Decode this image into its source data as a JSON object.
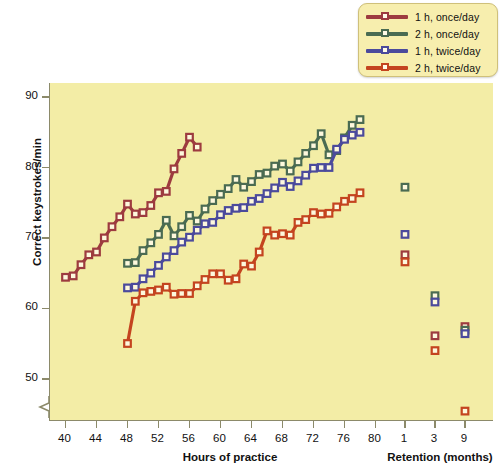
{
  "legend": {
    "items": [
      {
        "label": "1 h, once/day",
        "color": "#9d3b3f"
      },
      {
        "label": "2 h, once/day",
        "color": "#4a6b52"
      },
      {
        "label": "1 h, twice/day",
        "color": "#4b4a9c"
      },
      {
        "label": "2 h, twice/day",
        "color": "#c4441f"
      }
    ]
  },
  "chart_data": {
    "type": "line",
    "title": "",
    "xlabel": "Hours of practice",
    "ylabel": "Correct keystrokes/min",
    "secondary_xlabel": "Retention (months)",
    "xlim": [
      38,
      82
    ],
    "ylim": [
      44,
      92
    ],
    "yticks": [
      50,
      60,
      70,
      80,
      90
    ],
    "xticks": [
      40,
      44,
      48,
      52,
      56,
      60,
      64,
      68,
      72,
      76,
      80
    ],
    "retention_ticks": [
      1,
      3,
      9
    ],
    "grid": false,
    "legend_position": "top-right",
    "axis_break": true,
    "series": [
      {
        "name": "1 h, once/day",
        "color": "#9d3b3f",
        "x": [
          40,
          41,
          42,
          43,
          44,
          45,
          46,
          47,
          48,
          49,
          50,
          51,
          52,
          53,
          54,
          55,
          56,
          57
        ],
        "y": [
          64.4,
          64.6,
          66.2,
          67.6,
          68.0,
          70.0,
          71.6,
          73.0,
          74.8,
          73.4,
          73.6,
          74.6,
          76.4,
          76.6,
          79.8,
          82.0,
          84.3,
          82.9
        ],
        "retention": [
          {
            "months": 1,
            "value": 67.6
          },
          {
            "months": 3,
            "value": 56.1
          },
          {
            "months": 9,
            "value": 57.4
          }
        ]
      },
      {
        "name": "2 h, once/day",
        "color": "#4a6b52",
        "x": [
          48,
          49,
          50,
          51,
          52,
          53,
          54,
          55,
          56,
          57,
          58,
          59,
          60,
          61,
          62,
          63,
          64,
          65,
          66,
          67,
          68,
          69,
          70,
          71,
          72,
          73,
          74,
          75,
          76,
          77,
          78
        ],
        "y": [
          66.4,
          66.5,
          68.2,
          69.3,
          70.5,
          72.5,
          70.3,
          71.6,
          73.2,
          72.4,
          74.1,
          75.3,
          76.2,
          77.0,
          78.3,
          77.2,
          78.0,
          79.0,
          79.2,
          80.2,
          80.5,
          79.5,
          80.8,
          82.0,
          83.1,
          84.8,
          81.8,
          82.4,
          84.2,
          86.0,
          86.8
        ],
        "retention": [
          {
            "months": 1,
            "value": 77.2
          },
          {
            "months": 3,
            "value": 61.8
          },
          {
            "months": 9,
            "value": 56.9
          }
        ]
      },
      {
        "name": "1 h, twice/day",
        "color": "#4b4a9c",
        "x": [
          48,
          49,
          50,
          51,
          52,
          53,
          54,
          55,
          56,
          57,
          58,
          59,
          60,
          61,
          62,
          63,
          64,
          65,
          66,
          67,
          68,
          69,
          70,
          71,
          72,
          73,
          74,
          75,
          76,
          77,
          78
        ],
        "y": [
          62.9,
          63.0,
          64.2,
          65.0,
          66.1,
          67.3,
          68.2,
          69.4,
          70.1,
          71.1,
          72.0,
          72.2,
          73.3,
          73.9,
          74.2,
          74.3,
          75.2,
          75.6,
          76.3,
          77.1,
          77.9,
          77.3,
          78.1,
          78.9,
          79.9,
          80.0,
          80.0,
          82.6,
          84.0,
          84.6,
          85.0
        ],
        "retention": [
          {
            "months": 1,
            "value": 70.5
          },
          {
            "months": 3,
            "value": 60.9
          },
          {
            "months": 9,
            "value": 56.4
          }
        ]
      },
      {
        "name": "2 h, twice/day",
        "color": "#c4441f",
        "x": [
          48,
          49,
          50,
          51,
          52,
          53,
          54,
          55,
          56,
          57,
          58,
          59,
          60,
          61,
          62,
          63,
          64,
          65,
          66,
          67,
          68,
          69,
          70,
          71,
          72,
          73,
          74,
          75,
          76,
          77,
          78
        ],
        "y": [
          55.0,
          61.0,
          62.2,
          62.4,
          62.6,
          63.0,
          62.0,
          62.1,
          62.1,
          63.2,
          64.1,
          64.9,
          64.9,
          64.0,
          64.2,
          66.3,
          66.0,
          68.0,
          71.0,
          70.4,
          70.6,
          70.4,
          72.2,
          72.6,
          73.6,
          73.4,
          73.5,
          74.4,
          75.2,
          75.6,
          76.4
        ],
        "retention": [
          {
            "months": 1,
            "value": 66.6
          },
          {
            "months": 3,
            "value": 54.0
          },
          {
            "months": 9,
            "value": 45.4
          }
        ]
      }
    ]
  }
}
